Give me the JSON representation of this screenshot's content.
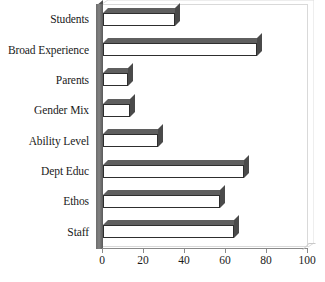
{
  "chart_data": {
    "type": "bar",
    "orientation": "horizontal",
    "title": "",
    "subtitle": "",
    "xlabel": "",
    "ylabel": "",
    "categories": [
      "Students",
      "Broad Experience",
      "Parents",
      "Gender Mix",
      "Ability Level",
      "Dept Educ",
      "Ethos",
      "Staff"
    ],
    "values": [
      35,
      75,
      12,
      13,
      27,
      69,
      57,
      64
    ],
    "series": [
      {
        "name": "",
        "values": [
          35,
          75,
          12,
          13,
          27,
          69,
          57,
          64
        ]
      }
    ],
    "xlim": [
      0,
      100
    ],
    "xticks": [
      0,
      20,
      40,
      60,
      80,
      100
    ],
    "xtick_labels": [
      "0",
      "20",
      "40",
      "60",
      "80",
      "100"
    ],
    "grid": false,
    "legend": false,
    "legend_position": "none",
    "style_3d": true,
    "colors": {
      "bar_face": "#ffffff",
      "bar_outline": "#2e2e2e",
      "bar_top": "#5f5f5f",
      "bar_side": "#4a4a4a",
      "axis_wall": "#7a7a7a",
      "axis_line": "#8a8a8a",
      "plot_border": "#d9d9d9",
      "text": "#1a1a1a",
      "background": "#ffffff"
    }
  }
}
